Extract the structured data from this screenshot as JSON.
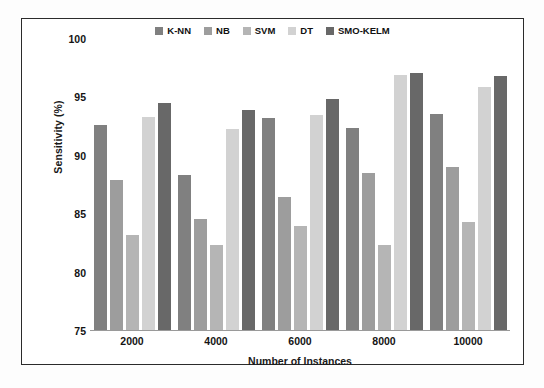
{
  "figure": {
    "border_color": "#2b2b2b",
    "background": "#ffffff"
  },
  "chart_data": {
    "type": "bar",
    "title": "",
    "xlabel": "Number of Instances",
    "ylabel": "Sensitivity (%)",
    "categories": [
      "2000",
      "4000",
      "6000",
      "8000",
      "10000"
    ],
    "ylim": [
      75,
      100
    ],
    "yticks": [
      75,
      80,
      85,
      90,
      95,
      100
    ],
    "grid": false,
    "legend_position": "top-center",
    "series": [
      {
        "name": "K-NN",
        "color": "#808080",
        "values": [
          92.6,
          88.4,
          93.2,
          92.4,
          93.6
        ]
      },
      {
        "name": "NB",
        "color": "#9d9d9d",
        "values": [
          87.9,
          84.6,
          86.5,
          88.5,
          89.0
        ]
      },
      {
        "name": "SVM",
        "color": "#b5b5b5",
        "values": [
          83.2,
          82.4,
          84.0,
          82.4,
          84.3
        ]
      },
      {
        "name": "DT",
        "color": "#d2d2d2",
        "values": [
          93.3,
          92.3,
          93.5,
          96.9,
          95.9
        ]
      },
      {
        "name": "SMO-KELM",
        "color": "#686868",
        "values": [
          94.5,
          93.9,
          94.9,
          97.1,
          96.8
        ]
      }
    ]
  }
}
